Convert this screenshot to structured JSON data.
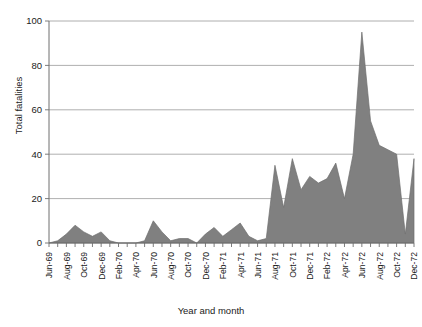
{
  "chart_data": {
    "type": "area",
    "title": "",
    "xlabel": "Year and month",
    "ylabel": "Total fatalities",
    "ylim": [
      0,
      100
    ],
    "yticks": [
      0,
      20,
      40,
      60,
      80,
      100
    ],
    "grid": true,
    "legend": "none",
    "fill_color": "#808080",
    "line_color": "#6e6e6e",
    "x": [
      "Jun-69",
      "Jul-69",
      "Aug-69",
      "Sep-69",
      "Oct-69",
      "Nov-69",
      "Dec-69",
      "Jan-70",
      "Feb-70",
      "Mar-70",
      "Apr-70",
      "May-70",
      "Jun-70",
      "Jul-70",
      "Aug-70",
      "Sep-70",
      "Oct-70",
      "Nov-70",
      "Dec-70",
      "Jan-71",
      "Feb-71",
      "Mar-71",
      "Apr-71",
      "May-71",
      "Jun-71",
      "Jul-71",
      "Aug-71",
      "Sep-71",
      "Oct-71",
      "Nov-71",
      "Dec-71",
      "Jan-72",
      "Feb-72",
      "Mar-72",
      "Apr-72",
      "May-72",
      "Jun-72",
      "Jul-72",
      "Aug-72",
      "Sep-72",
      "Oct-72",
      "Nov-72",
      "Dec-72"
    ],
    "xtick_labels": [
      "Jun-69",
      "Aug-69",
      "Oct-69",
      "Dec-69",
      "Feb-70",
      "Apr-70",
      "Jun-70",
      "Aug-70",
      "Oct-70",
      "Dec-70",
      "Feb-71",
      "Apr-71",
      "Jun-71",
      "Aug-71",
      "Oct-71",
      "Dec-71",
      "Feb-72",
      "Apr-72",
      "Jun-72",
      "Aug-72",
      "Oct-72",
      "Dec-72"
    ],
    "values": [
      0,
      1,
      4,
      8,
      5,
      3,
      5,
      1,
      0,
      0,
      0,
      1,
      10,
      5,
      1,
      2,
      2,
      0,
      4,
      7,
      3,
      6,
      9,
      3,
      1,
      2,
      35,
      16,
      38,
      24,
      30,
      27,
      29,
      36,
      20,
      40,
      95,
      55,
      44,
      42,
      40,
      4,
      38
    ],
    "series": [
      {
        "name": "Total fatalities",
        "values": [
          0,
          1,
          4,
          8,
          5,
          3,
          5,
          1,
          0,
          0,
          0,
          1,
          10,
          5,
          1,
          2,
          2,
          0,
          4,
          7,
          3,
          6,
          9,
          3,
          1,
          2,
          35,
          16,
          38,
          24,
          30,
          27,
          29,
          36,
          20,
          40,
          95,
          55,
          44,
          42,
          40,
          4,
          38
        ]
      }
    ]
  }
}
